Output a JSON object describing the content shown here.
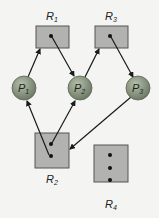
{
  "diagram": {
    "colors": {
      "background": "#f4f4f3",
      "resource_fill": "#b2b2b0",
      "resource_stroke": "#555555",
      "process_fill": "#8f9a86",
      "edge": "#1a1a1a"
    },
    "resources": [
      {
        "id": "R1",
        "label": "R",
        "sub": "1",
        "instances": 1
      },
      {
        "id": "R2",
        "label": "R",
        "sub": "2",
        "instances": 2
      },
      {
        "id": "R3",
        "label": "R",
        "sub": "3",
        "instances": 1
      },
      {
        "id": "R4",
        "label": "R",
        "sub": "4",
        "instances": 3
      }
    ],
    "processes": [
      {
        "id": "P1",
        "label": "P",
        "sub": "1"
      },
      {
        "id": "P2",
        "label": "P",
        "sub": "2"
      },
      {
        "id": "P3",
        "label": "P",
        "sub": "3"
      }
    ],
    "edges": [
      {
        "from": "P1",
        "to": "R1",
        "type": "request"
      },
      {
        "from": "R1",
        "to": "P2",
        "type": "assignment"
      },
      {
        "from": "P2",
        "to": "R3",
        "type": "request"
      },
      {
        "from": "R3",
        "to": "P3",
        "type": "assignment"
      },
      {
        "from": "R2",
        "to": "P1",
        "type": "assignment"
      },
      {
        "from": "R2",
        "to": "P2",
        "type": "assignment"
      },
      {
        "from": "P3",
        "to": "R2",
        "type": "request"
      }
    ]
  }
}
